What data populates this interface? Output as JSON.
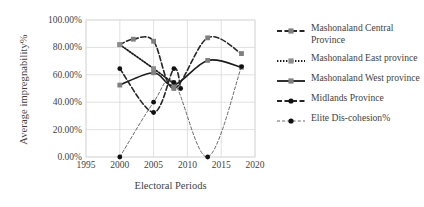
{
  "chart_data": {
    "type": "line",
    "title": "",
    "xlabel": "Electoral Periods",
    "ylabel": "Average impregnability%",
    "xlim": [
      1995,
      2020
    ],
    "ylim": [
      0,
      1.0
    ],
    "grid": true,
    "legend_position": "right",
    "x_ticks": [
      "1995",
      "2000",
      "2005",
      "2010",
      "2015",
      "2020"
    ],
    "y_ticks": [
      "0.00%",
      "20.00%",
      "40.00%",
      "60.00%",
      "80.00%",
      "100.00%"
    ],
    "series": [
      {
        "name": "Mashonaland Central Province",
        "color": "#7f7f7f",
        "line_color": "#262626",
        "line_style": "dashed",
        "marker": "square",
        "x": [
          2000,
          2002,
          2005,
          2008,
          2013,
          2018
        ],
        "values": [
          0.82,
          0.86,
          0.845,
          0.5,
          0.87,
          0.755
        ]
      },
      {
        "name": "Mashonaland East province",
        "color": "#8c8c8c",
        "line_color": "#1a1a1a",
        "line_style": "dotted",
        "marker": "square",
        "x": [
          2000,
          2005,
          2008
        ],
        "values": [
          0.82,
          0.645,
          0.535
        ]
      },
      {
        "name": "Mashonaland West Province",
        "color": "#808080",
        "line_color": "#1a1a1a",
        "line_style": "solid",
        "marker": "square",
        "x": [
          2000,
          2005,
          2008,
          2013,
          2018
        ],
        "values": [
          0.525,
          0.615,
          0.525,
          0.705,
          0.655
        ]
      },
      {
        "name": "Midlands Province",
        "color": "#111111",
        "line_color": "#262626",
        "line_style": "dashed",
        "marker": "circle",
        "x": [
          2000,
          2005,
          2008,
          2009
        ],
        "values": [
          0.645,
          0.325,
          0.645,
          0.5
        ]
      },
      {
        "name": "Elite Dis-cohesion%",
        "color": "#111111",
        "line_color": "#555555",
        "line_style": "fine-dashed",
        "marker": "circle",
        "x": [
          2000,
          2005,
          2008,
          2013,
          2018
        ],
        "values": [
          0.0,
          0.4,
          0.545,
          0.0,
          0.66
        ]
      }
    ]
  },
  "axes": {
    "y_title": "Average impregnability%",
    "x_title": "Electoral Periods"
  },
  "legend": {
    "items": [
      {
        "label": "Mashonaland Central Province",
        "swatch": "dashed-gray-square-marker"
      },
      {
        "label": "Mashonaland East province",
        "swatch": "dotted-gray-square-marker"
      },
      {
        "label": "Mashonaland West province",
        "swatch": "solid-gray-square-marker"
      },
      {
        "label": "Midlands Province",
        "swatch": "dashed-black-circle-marker"
      },
      {
        "label": "Elite Dis-cohesion%",
        "swatch": "fine-dotted-black-square-marker"
      }
    ]
  }
}
